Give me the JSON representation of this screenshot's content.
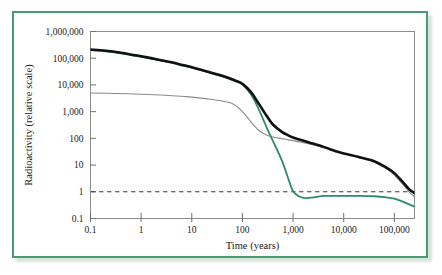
{
  "figure": {
    "border_color": "#4a9b72",
    "background": "#ffffff"
  },
  "chart_data": {
    "type": "line",
    "title": "",
    "xlabel": "Time (years)",
    "ylabel": "Radioactivity (relative scale)",
    "xscale": "log",
    "yscale": "log",
    "xlim": [
      0.1,
      250000
    ],
    "ylim": [
      0.1,
      1000000
    ],
    "grid": false,
    "legend_position": "none",
    "xtick_labels": [
      "0.1",
      "1",
      "10",
      "100",
      "1,000",
      "10,000",
      "100,000"
    ],
    "xtick_values": [
      0.1,
      1,
      10,
      100,
      1000,
      10000,
      100000
    ],
    "ytick_labels": [
      "0.1",
      "1",
      "10",
      "100",
      "1,000",
      "10,000",
      "100,000",
      "1,000,000"
    ],
    "ytick_values": [
      0.1,
      1,
      10,
      100,
      1000,
      10000,
      100000,
      1000000
    ],
    "reference_line": {
      "name": "natural-uranium-ore-level",
      "y": 1,
      "style": "dashed",
      "color": "#3a3a3a"
    },
    "series": [
      {
        "name": "total-spent-fuel",
        "color": "#111111",
        "width": 2.6,
        "points": [
          [
            0.1,
            210000
          ],
          [
            0.2,
            190000
          ],
          [
            0.4,
            160000
          ],
          [
            0.7,
            132000
          ],
          [
            1,
            118000
          ],
          [
            2,
            92000
          ],
          [
            4,
            70000
          ],
          [
            7,
            54000
          ],
          [
            10,
            46000
          ],
          [
            20,
            32000
          ],
          [
            40,
            22000
          ],
          [
            70,
            15000
          ],
          [
            100,
            11000
          ],
          [
            150,
            5200
          ],
          [
            200,
            2300
          ],
          [
            300,
            700
          ],
          [
            400,
            330
          ],
          [
            600,
            175
          ],
          [
            800,
            130
          ],
          [
            1000,
            108
          ],
          [
            2000,
            72
          ],
          [
            4000,
            48
          ],
          [
            7000,
            33
          ],
          [
            10000,
            27
          ],
          [
            20000,
            20
          ],
          [
            40000,
            14
          ],
          [
            70000,
            8
          ],
          [
            100000,
            5
          ],
          [
            150000,
            2.2
          ],
          [
            200000,
            1.2
          ],
          [
            250000,
            0.9
          ]
        ]
      },
      {
        "name": "reprocessed-waste",
        "color": "#2e8b6f",
        "width": 1.8,
        "points": [
          [
            0.1,
            200000
          ],
          [
            0.2,
            182000
          ],
          [
            0.4,
            153000
          ],
          [
            0.7,
            126000
          ],
          [
            1,
            113000
          ],
          [
            2,
            88000
          ],
          [
            4,
            67000
          ],
          [
            7,
            51500
          ],
          [
            10,
            44000
          ],
          [
            20,
            30500
          ],
          [
            40,
            21000
          ],
          [
            70,
            14200
          ],
          [
            100,
            10400
          ],
          [
            150,
            4200
          ],
          [
            200,
            1500
          ],
          [
            300,
            260
          ],
          [
            400,
            80
          ],
          [
            600,
            15
          ],
          [
            800,
            3.2
          ],
          [
            1000,
            1.05
          ],
          [
            1300,
            0.68
          ],
          [
            1700,
            0.58
          ],
          [
            2500,
            0.62
          ],
          [
            4000,
            0.7
          ],
          [
            7000,
            0.7
          ],
          [
            10000,
            0.7
          ],
          [
            20000,
            0.7
          ],
          [
            40000,
            0.68
          ],
          [
            70000,
            0.62
          ],
          [
            100000,
            0.55
          ],
          [
            150000,
            0.42
          ],
          [
            200000,
            0.33
          ],
          [
            250000,
            0.28
          ]
        ]
      },
      {
        "name": "fission-products",
        "color": "#8a8a8a",
        "width": 1.1,
        "points": [
          [
            0.1,
            5000
          ],
          [
            0.3,
            4800
          ],
          [
            1,
            4500
          ],
          [
            3,
            4100
          ],
          [
            7,
            3700
          ],
          [
            10,
            3500
          ],
          [
            20,
            3000
          ],
          [
            40,
            2500
          ],
          [
            60,
            2100
          ],
          [
            80,
            1500
          ],
          [
            100,
            1000
          ],
          [
            130,
            560
          ],
          [
            170,
            300
          ],
          [
            220,
            185
          ],
          [
            300,
            135
          ],
          [
            400,
            112
          ],
          [
            600,
            98
          ],
          [
            800,
            88
          ],
          [
            1000,
            82
          ],
          [
            2000,
            63
          ],
          [
            4000,
            45
          ],
          [
            7000,
            33
          ],
          [
            10000,
            27
          ],
          [
            20000,
            19
          ],
          [
            40000,
            13
          ],
          [
            70000,
            7.2
          ],
          [
            100000,
            4.2
          ],
          [
            150000,
            1.8
          ],
          [
            200000,
            0.95
          ],
          [
            250000,
            0.65
          ]
        ]
      }
    ]
  }
}
